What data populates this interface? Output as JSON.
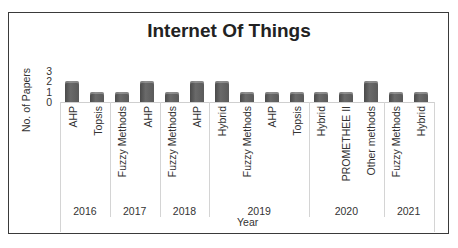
{
  "chart_data": {
    "type": "bar",
    "title": "Internet Of Things",
    "xlabel": "Year",
    "ylabel": "No. of Papers",
    "ylim": [
      0,
      3
    ],
    "yticks": [
      "0",
      "1",
      "2",
      "3"
    ],
    "grid": false,
    "legend": null,
    "groups": [
      {
        "year": "2016",
        "categories": [
          "AHP",
          "Topsis"
        ],
        "values": [
          2,
          1
        ]
      },
      {
        "year": "2017",
        "categories": [
          "Fuzzy Methods",
          "AHP"
        ],
        "values": [
          1,
          2
        ]
      },
      {
        "year": "2018",
        "categories": [
          "Fuzzy Methods",
          "AHP"
        ],
        "values": [
          1,
          2
        ]
      },
      {
        "year": "2019",
        "categories": [
          "Hybrid",
          "Fuzzy Methods",
          "AHP",
          "Topsis"
        ],
        "values": [
          2,
          1,
          1,
          1
        ]
      },
      {
        "year": "2020",
        "categories": [
          "Hybrid",
          "PROMETHEE II",
          "Other methods"
        ],
        "values": [
          1,
          1,
          2
        ]
      },
      {
        "year": "2021",
        "categories": [
          "Fuzzy Methods",
          "Hybrid"
        ],
        "values": [
          1,
          1
        ]
      }
    ],
    "bar_color": "#5a5a5a"
  }
}
